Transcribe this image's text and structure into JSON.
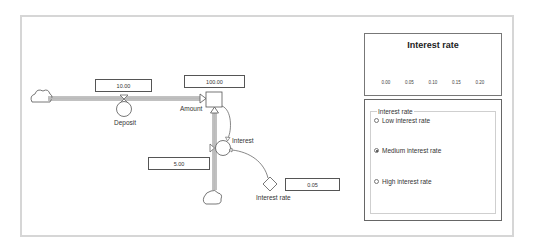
{
  "diagram": {
    "stocks": [
      {
        "name": "Amount",
        "value": "100.00"
      }
    ],
    "flows": [
      {
        "name": "Deposit",
        "value": "10.00"
      },
      {
        "name": "Interest",
        "value": "5.00"
      }
    ],
    "auxiliaries": [
      {
        "name": "Interest rate",
        "value": "0.05"
      }
    ]
  },
  "slider": {
    "title": "Interest rate",
    "value": 0.05,
    "min": 0.0,
    "max": 0.2,
    "ticks": [
      "0.00",
      "0.05",
      "0.10",
      "0.15",
      "0.20"
    ],
    "left_arrow": "left-arrow-icon",
    "right_arrow": "right-arrow-icon"
  },
  "radio_group": {
    "legend": "Interest rate",
    "options": [
      {
        "label": "Low interest rate",
        "checked": false
      },
      {
        "label": "Medium interest rate",
        "checked": true
      },
      {
        "label": "High interest rate",
        "checked": false
      }
    ]
  },
  "colors": {
    "frame_border": "#d6d6d6",
    "line": "#555555",
    "pipe": "#777777"
  }
}
